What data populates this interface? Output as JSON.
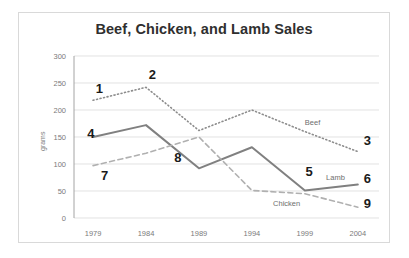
{
  "card": {
    "title": "Beef, Chicken, and Lamb Sales"
  },
  "chart_data": {
    "type": "line",
    "title": "Beef, Chicken, and Lamb Sales",
    "xlabel": "",
    "ylabel": "grams",
    "categories": [
      "1979",
      "1984",
      "1989",
      "1994",
      "1999",
      "2004"
    ],
    "x": [
      1979,
      1984,
      1989,
      1994,
      1999,
      2004
    ],
    "ylim": [
      0,
      300
    ],
    "yticks": [
      0,
      50,
      100,
      150,
      200,
      250,
      300
    ],
    "ytick_labels": [
      "0",
      "50",
      "100",
      "150",
      "200",
      "250",
      "300"
    ],
    "grid": "horizontal",
    "legend": "inline-labels",
    "series": [
      {
        "name": "Beef",
        "style": "dotted",
        "color": "#8c8c8c",
        "values": [
          218,
          242,
          162,
          200,
          160,
          123
        ],
        "label_text": "Beef",
        "label_x": 1999,
        "label_y": 172
      },
      {
        "name": "Lamb",
        "style": "solid",
        "color": "#808080",
        "values": [
          150,
          172,
          92,
          131,
          51,
          62
        ],
        "label_text": "Lamb",
        "label_x": 2001,
        "label_y": 70
      },
      {
        "name": "Chicken",
        "style": "dashed",
        "color": "#b0b0b0",
        "values": [
          97,
          120,
          150,
          51,
          45,
          20
        ],
        "label_text": "Chicken",
        "label_x": 1996,
        "label_y": 22
      }
    ],
    "annotations": [
      {
        "text": "1",
        "x": 1979.6,
        "y": 232,
        "series": "Beef"
      },
      {
        "text": "2",
        "x": 1984.6,
        "y": 258,
        "series": "Beef"
      },
      {
        "text": "3",
        "x": 2004.9,
        "y": 136,
        "series": "Beef"
      },
      {
        "text": "4",
        "x": 1978.8,
        "y": 148,
        "series": "Lamb"
      },
      {
        "text": "5",
        "x": 1999.4,
        "y": 78,
        "series": "Lamb"
      },
      {
        "text": "6",
        "x": 2004.9,
        "y": 65,
        "series": "Lamb"
      },
      {
        "text": "7",
        "x": 1980.1,
        "y": 70,
        "series": "Chicken"
      },
      {
        "text": "8",
        "x": 1987.0,
        "y": 104,
        "series": "Chicken"
      },
      {
        "text": "9",
        "x": 2004.9,
        "y": 18,
        "series": "Chicken"
      }
    ]
  }
}
